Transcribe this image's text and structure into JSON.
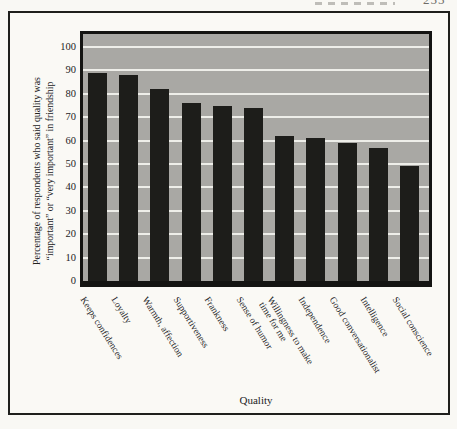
{
  "page_header": {
    "page_number_fragment": "255"
  },
  "axes": {
    "y_title_line1": "Percentage of respondents who said quality was",
    "y_title_line2": "“important” or “very important” in friendship",
    "x_title": "Quality"
  },
  "chart_data": {
    "type": "bar",
    "title": "",
    "categories": [
      "Keeps confidences",
      "Loyalty",
      "Warmth, affection",
      "Supportiveness",
      "Frankness",
      "Sense of humor",
      "Willingness to make\ntime for me",
      "Independence",
      "Good conversationalist",
      "Intelligence",
      "Social conscience"
    ],
    "values": [
      89,
      88,
      82,
      76,
      75,
      74,
      62,
      61,
      59,
      57,
      49
    ],
    "xlabel": "Quality",
    "ylabel": "Percentage of respondents who said quality was “important” or “very important” in friendship",
    "ylim": [
      0,
      106
    ],
    "yticks": [
      0,
      10,
      20,
      30,
      40,
      50,
      60,
      70,
      80,
      90,
      100
    ],
    "grid": "horizontal white gridlines on gray plot background",
    "legend": "none",
    "colors": {
      "bar": "#1d1d1a",
      "plot_bg": "#a9a8a4",
      "gridline": "#eeeee9",
      "frame": "#1a1a18",
      "page_bg": "#f9f8f4"
    }
  }
}
